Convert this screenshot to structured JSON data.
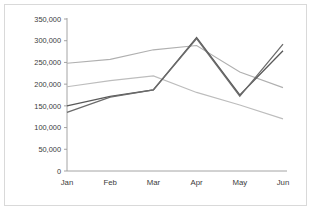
{
  "chart_data": {
    "type": "line",
    "title": "",
    "xlabel": "",
    "ylabel": "",
    "categories": [
      "Jan",
      "Feb",
      "Mar",
      "Apr",
      "May",
      "Jun"
    ],
    "ylim": [
      0,
      350000
    ],
    "ytick_values": [
      0,
      50000,
      100000,
      150000,
      200000,
      250000,
      300000,
      350000
    ],
    "ytick_labels": [
      "0",
      "50,000",
      "100,000",
      "150,000",
      "200,000",
      "250,000",
      "300,000",
      "350,000"
    ],
    "grid": false,
    "legend": "none",
    "series": [
      {
        "name": "series-1",
        "color": "#595959",
        "width": 1.3,
        "values": [
          150000,
          172000,
          187000,
          307000,
          175000,
          277000
        ]
      },
      {
        "name": "series-2",
        "color": "#6b6b6b",
        "width": 1.3,
        "values": [
          135000,
          170000,
          187000,
          305000,
          172000,
          292000
        ]
      },
      {
        "name": "series-3",
        "color": "#b0b0b0",
        "width": 1.1,
        "values": [
          248000,
          257000,
          279000,
          289000,
          228000,
          192000
        ]
      },
      {
        "name": "series-4",
        "color": "#bdbdbd",
        "width": 1.1,
        "values": [
          194000,
          208000,
          219000,
          181000,
          152000,
          120000
        ]
      }
    ]
  },
  "axis": {
    "y_axis_name": "value-axis",
    "x_axis_name": "category-axis"
  }
}
